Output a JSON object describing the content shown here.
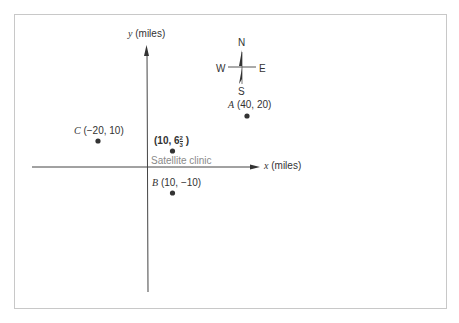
{
  "diagram": {
    "axes": {
      "x_label_var": "x",
      "x_label_unit": "(miles)",
      "y_label_var": "y",
      "y_label_unit": "(miles)"
    },
    "compass": {
      "north": "N",
      "south": "S",
      "east": "E",
      "west": "W"
    },
    "points": [
      {
        "name": "A",
        "coords": "(40, 20)",
        "x": 40,
        "y": 20
      },
      {
        "name": "B",
        "coords": "(10, −10)",
        "x": 10,
        "y": -10
      },
      {
        "name": "C",
        "coords": "(−20, 10)",
        "x": -20,
        "y": 10
      }
    ],
    "clinic": {
      "coords_prefix": "(10, 6",
      "frac_num": "2",
      "frac_den": "3",
      "coords_suffix": ")",
      "x": 10,
      "y": 6.667,
      "label": "Satellite clinic"
    }
  }
}
